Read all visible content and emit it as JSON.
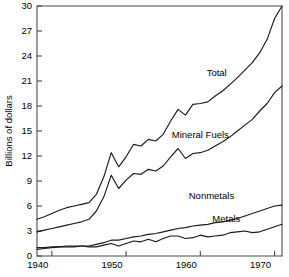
{
  "chart_data": {
    "type": "line",
    "title": "",
    "subtitle": "",
    "xlabel": "",
    "ylabel": "Billions of dollars",
    "xlim": [
      1938,
      1971
    ],
    "ylim": [
      0,
      30
    ],
    "grid": false,
    "legend_position": "inline-annotations",
    "x_ticks": [
      1940,
      1950,
      1960,
      1970
    ],
    "x_tick_labels": [
      "1940",
      "1950",
      "1960",
      "1970"
    ],
    "y_ticks": [
      0,
      3,
      6,
      9,
      12,
      15,
      18,
      21,
      24,
      27,
      30
    ],
    "y_tick_labels": [
      "0",
      "3",
      "6",
      "9",
      "12",
      "15",
      "18",
      "21",
      "24",
      "27",
      "30"
    ],
    "annotations": [
      {
        "text": "Total",
        "x": 1962.2,
        "y": 21.6
      },
      {
        "text": "Mineral Fuels",
        "x": 1960.0,
        "y": 14.2
      },
      {
        "text": "Nonmetals",
        "x": 1961.5,
        "y": 6.9
      },
      {
        "text": "Metals",
        "x": 1963.5,
        "y": 4.1
      }
    ],
    "x": [
      1938,
      1939,
      1940,
      1941,
      1942,
      1943,
      1944,
      1945,
      1946,
      1947,
      1948,
      1949,
      1950,
      1951,
      1952,
      1953,
      1954,
      1955,
      1956,
      1957,
      1958,
      1959,
      1960,
      1961,
      1962,
      1963,
      1964,
      1965,
      1966,
      1967,
      1968,
      1969,
      1970,
      1971
    ],
    "series": [
      {
        "name": "Total",
        "values": [
          4.4,
          4.7,
          5.1,
          5.5,
          5.8,
          6.0,
          6.2,
          6.4,
          7.4,
          9.5,
          12.4,
          10.7,
          11.9,
          13.4,
          13.2,
          14.0,
          13.8,
          14.6,
          16.2,
          17.6,
          16.9,
          18.2,
          18.3,
          18.5,
          19.2,
          19.8,
          20.6,
          21.4,
          22.3,
          23.2,
          24.4,
          26.0,
          28.5,
          30.0
        ]
      },
      {
        "name": "Mineral Fuels",
        "values": [
          2.9,
          3.1,
          3.3,
          3.5,
          3.7,
          3.9,
          4.1,
          4.4,
          5.4,
          7.1,
          9.7,
          8.1,
          9.1,
          9.9,
          9.8,
          10.4,
          10.2,
          10.8,
          11.9,
          12.9,
          11.7,
          12.3,
          12.4,
          12.7,
          13.2,
          13.7,
          14.3,
          15.0,
          15.7,
          16.4,
          17.4,
          18.3,
          19.6,
          20.4
        ]
      },
      {
        "name": "Nonmetals",
        "values": [
          1.0,
          1.0,
          1.1,
          1.1,
          1.1,
          1.1,
          1.2,
          1.2,
          1.4,
          1.6,
          1.9,
          1.9,
          2.1,
          2.3,
          2.4,
          2.6,
          2.7,
          2.9,
          3.1,
          3.3,
          3.4,
          3.6,
          3.7,
          3.8,
          4.0,
          4.1,
          4.3,
          4.5,
          4.8,
          5.1,
          5.4,
          5.7,
          6.0,
          6.1
        ]
      },
      {
        "name": "Metals",
        "values": [
          0.8,
          0.9,
          1.0,
          1.1,
          1.2,
          1.2,
          1.2,
          1.1,
          1.1,
          1.3,
          1.5,
          1.2,
          1.5,
          1.8,
          1.7,
          2.0,
          1.7,
          2.1,
          2.4,
          2.4,
          2.1,
          2.2,
          2.5,
          2.3,
          2.4,
          2.5,
          2.8,
          2.9,
          3.0,
          2.8,
          2.9,
          3.2,
          3.5,
          3.8
        ]
      }
    ]
  },
  "axis": {
    "y_title": "Billions of dollars"
  }
}
